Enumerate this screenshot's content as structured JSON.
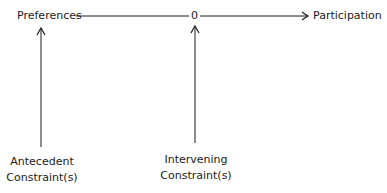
{
  "diagram": {
    "nodes": {
      "preferences": "Preferences",
      "zero": "0",
      "participation": "Participation",
      "antecedent_line1": "Antecedent",
      "antecedent_line2": "Constraint(s)",
      "intervening_line1": "Intervening",
      "intervening_line2": "Constraint(s)"
    },
    "edges": [
      {
        "from": "Preferences",
        "to": "0",
        "type": "line"
      },
      {
        "from": "0",
        "to": "Participation",
        "type": "arrow"
      },
      {
        "from": "Antecedent Constraint(s)",
        "to": "Preferences",
        "type": "arrow"
      },
      {
        "from": "Intervening Constraint(s)",
        "to": "0",
        "type": "arrow"
      }
    ],
    "line_color": "#1a1a1a"
  }
}
